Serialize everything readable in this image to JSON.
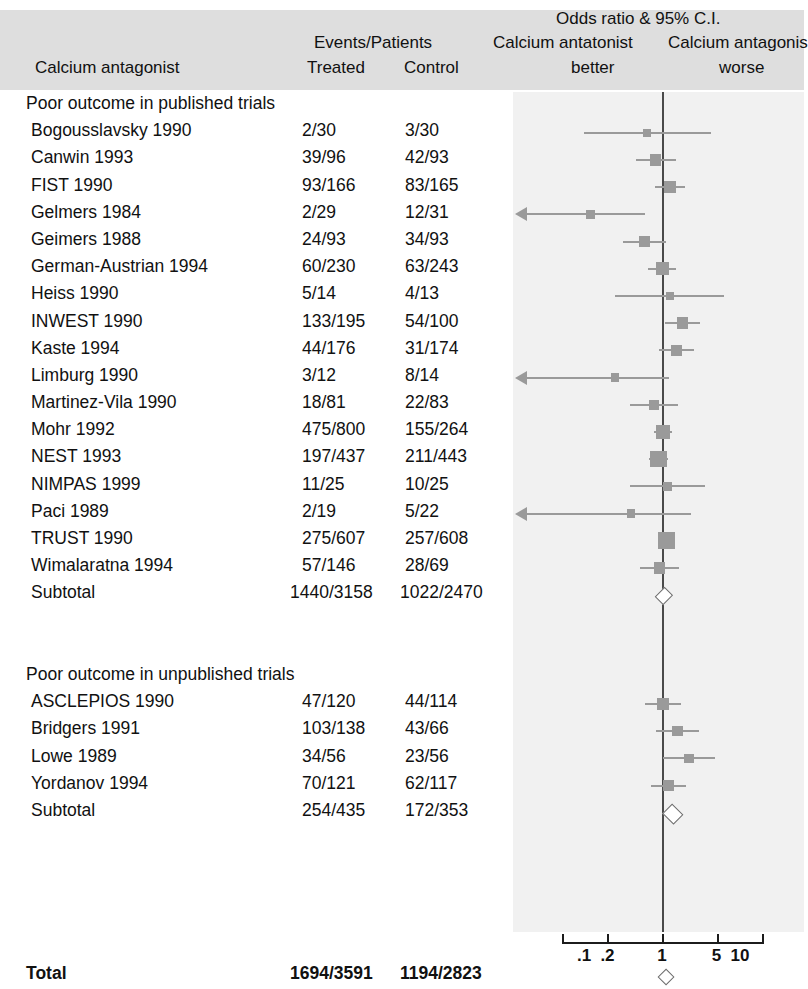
{
  "header": {
    "col_trial": "Calcium antagonist",
    "events_patients": "Events/Patients",
    "col_treated": "Treated",
    "col_control": "Control",
    "plot_title": "Odds ratio & 95% C.I.",
    "left_side": "Calcium antatonist",
    "left_side2": "better",
    "right_side": "Calcium antagonis",
    "right_side2": "worse"
  },
  "sections": [
    {
      "title": "Poor outcome in published trials",
      "rows": [
        {
          "label": "Bogousslavsky 1990",
          "treated": "2/30",
          "control": "3/30"
        },
        {
          "label": "Canwin 1993",
          "treated": "39/96",
          "control": "42/93"
        },
        {
          "label": "FIST 1990",
          "treated": "93/166",
          "control": "83/165"
        },
        {
          "label": "Gelmers 1984",
          "treated": "2/29",
          "control": "12/31"
        },
        {
          "label": "Geimers 1988",
          "treated": "24/93",
          "control": "34/93"
        },
        {
          "label": "German-Austrian 1994",
          "treated": "60/230",
          "control": "63/243"
        },
        {
          "label": "Heiss 1990",
          "treated": "5/14",
          "control": "4/13"
        },
        {
          "label": "INWEST 1990",
          "treated": "133/195",
          "control": "54/100"
        },
        {
          "label": "Kaste 1994",
          "treated": "44/176",
          "control": "31/174"
        },
        {
          "label": "Limburg 1990",
          "treated": "3/12",
          "control": "8/14"
        },
        {
          "label": "Martinez-Vila 1990",
          "treated": "18/81",
          "control": "22/83"
        },
        {
          "label": "Mohr 1992",
          "treated": "475/800",
          "control": "155/264"
        },
        {
          "label": "NEST 1993",
          "treated": "197/437",
          "control": "211/443"
        },
        {
          "label": "NIMPAS 1999",
          "treated": "11/25",
          "control": "10/25"
        },
        {
          "label": "Paci 1989",
          "treated": "2/19",
          "control": "5/22"
        },
        {
          "label": "TRUST 1990",
          "treated": "275/607",
          "control": "257/608"
        },
        {
          "label": "Wimalaratna 1994",
          "treated": "57/146",
          "control": "28/69"
        },
        {
          "label": "Subtotal",
          "treated": "1440/3158",
          "control": "1022/2470"
        }
      ]
    },
    {
      "title": "Poor outcome in unpublished trials",
      "rows": [
        {
          "label": "ASCLEPIOS 1990",
          "treated": "47/120",
          "control": "44/114"
        },
        {
          "label": "Bridgers 1991",
          "treated": "103/138",
          "control": "43/66"
        },
        {
          "label": "Lowe 1989",
          "treated": "34/56",
          "control": "23/56"
        },
        {
          "label": "Yordanov 1994",
          "treated": "70/121",
          "control": "62/117"
        },
        {
          "label": "Subtotal",
          "treated": "254/435",
          "control": "172/353"
        }
      ]
    }
  ],
  "total": {
    "label": "Total",
    "treated": "1694/3591",
    "control": "1194/2823"
  },
  "axis": {
    "ticks": [
      {
        "label": ".1",
        "value": 0.1
      },
      {
        "label": ".2",
        "value": 0.2
      },
      {
        "label": "1",
        "value": 1
      },
      {
        "label": "5",
        "value": 5
      },
      {
        "label": "10",
        "value": 10
      }
    ]
  },
  "colors": {
    "header_band": "#dedede",
    "plot_background": "#f1f1f1",
    "marker": "#9a9a9a",
    "zero_line": "#4a4a4a",
    "diamond_stroke": "#6d6d6d"
  },
  "chart_data": {
    "type": "forest",
    "title": "Odds ratio & 95% C.I.",
    "xlabel": "Odds ratio (log scale)",
    "xlim": [
      0.1,
      10
    ],
    "log_scale": true,
    "null_value": 1,
    "studies": [
      {
        "name": "Bogousslavsky 1990",
        "group": "published",
        "or": 0.64,
        "ci_low": 0.1,
        "ci_high": 4.2,
        "weight": 0.6,
        "arrow_left": false
      },
      {
        "name": "Canwin 1993",
        "group": "published",
        "or": 0.83,
        "ci_low": 0.46,
        "ci_high": 1.49,
        "weight": 1.3,
        "arrow_left": false
      },
      {
        "name": "FIST 1990",
        "group": "published",
        "or": 1.26,
        "ci_low": 0.81,
        "ci_high": 1.95,
        "weight": 1.6,
        "arrow_left": false
      },
      {
        "name": "Gelmers 1984",
        "group": "published",
        "or": 0.12,
        "ci_low": 0.02,
        "ci_high": 0.6,
        "weight": 0.7,
        "arrow_left": true
      },
      {
        "name": "Geimers 1988",
        "group": "published",
        "or": 0.6,
        "ci_low": 0.32,
        "ci_high": 1.12,
        "weight": 1.2,
        "arrow_left": false
      },
      {
        "name": "German-Austrian 1994",
        "group": "published",
        "or": 1.01,
        "ci_low": 0.67,
        "ci_high": 1.51,
        "weight": 1.7,
        "arrow_left": false
      },
      {
        "name": "Heiss 1990",
        "group": "published",
        "or": 1.25,
        "ci_low": 0.25,
        "ci_high": 6.2,
        "weight": 0.5,
        "arrow_left": false
      },
      {
        "name": "INWEST 1990",
        "group": "published",
        "or": 1.83,
        "ci_low": 1.1,
        "ci_high": 3.03,
        "weight": 1.4,
        "arrow_left": false
      },
      {
        "name": "Kaste 1994",
        "group": "published",
        "or": 1.54,
        "ci_low": 0.92,
        "ci_high": 2.57,
        "weight": 1.4,
        "arrow_left": false
      },
      {
        "name": "Limburg 1990",
        "group": "published",
        "or": 0.25,
        "ci_low": 0.05,
        "ci_high": 1.24,
        "weight": 0.6,
        "arrow_left": true
      },
      {
        "name": "Martinez-Vila 1990",
        "group": "published",
        "or": 0.79,
        "ci_low": 0.39,
        "ci_high": 1.6,
        "weight": 1.0,
        "arrow_left": false
      },
      {
        "name": "Mohr 1992",
        "group": "published",
        "or": 1.03,
        "ci_low": 0.78,
        "ci_high": 1.36,
        "weight": 2.0,
        "arrow_left": false
      },
      {
        "name": "NEST 1993",
        "group": "published",
        "or": 0.9,
        "ci_low": 0.69,
        "ci_high": 1.18,
        "weight": 2.6,
        "arrow_left": false
      },
      {
        "name": "NIMPAS 1999",
        "group": "published",
        "or": 1.18,
        "ci_low": 0.39,
        "ci_high": 3.57,
        "weight": 0.8,
        "arrow_left": false
      },
      {
        "name": "Paci 1989",
        "group": "published",
        "or": 0.4,
        "ci_low": 0.07,
        "ci_high": 2.35,
        "weight": 0.6,
        "arrow_left": true
      },
      {
        "name": "TRUST 1990",
        "group": "published",
        "or": 1.13,
        "ci_low": 0.9,
        "ci_high": 1.43,
        "weight": 2.8,
        "arrow_left": false
      },
      {
        "name": "Wimalaratna 1994",
        "group": "published",
        "or": 0.94,
        "ci_low": 0.53,
        "ci_high": 1.67,
        "weight": 1.3,
        "arrow_left": false
      },
      {
        "name": "ASCLEPIOS 1990",
        "group": "unpublished",
        "or": 1.03,
        "ci_low": 0.61,
        "ci_high": 1.73,
        "weight": 1.4,
        "arrow_left": false
      },
      {
        "name": "Bridgers 1991",
        "group": "unpublished",
        "or": 1.58,
        "ci_low": 0.84,
        "ci_high": 2.96,
        "weight": 1.1,
        "arrow_left": false
      },
      {
        "name": "Lowe 1989",
        "group": "unpublished",
        "or": 2.22,
        "ci_low": 1.03,
        "ci_high": 4.78,
        "weight": 0.9,
        "arrow_left": false
      },
      {
        "name": "Yordanov 1994",
        "group": "unpublished",
        "or": 1.22,
        "ci_low": 0.73,
        "ci_high": 2.04,
        "weight": 1.3,
        "arrow_left": false
      }
    ],
    "summaries": [
      {
        "name": "Subtotal published",
        "or": 1.04,
        "ci_low": 0.93,
        "ci_high": 1.16,
        "group": "published"
      },
      {
        "name": "Subtotal unpublished",
        "or": 1.32,
        "ci_low": 1.0,
        "ci_high": 1.74,
        "group": "unpublished"
      },
      {
        "name": "Total",
        "or": 1.08,
        "ci_low": 0.98,
        "ci_high": 1.2,
        "group": "total"
      }
    ]
  }
}
